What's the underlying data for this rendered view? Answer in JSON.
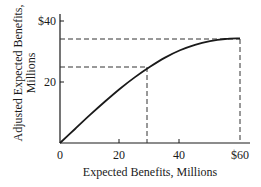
{
  "chart_data": {
    "type": "line",
    "title": "",
    "xlabel": "Expected Benefits, Millions",
    "ylabel_lines": [
      "Adjusted Expected Benefits,",
      "Millions"
    ],
    "ylabel": "Adjusted Expected Benefits, Millions",
    "xlim": [
      0,
      63
    ],
    "ylim": [
      0,
      40
    ],
    "x_ticks": [
      0,
      20,
      40,
      60
    ],
    "x_tick_labels": [
      "0",
      "20",
      "40",
      "$60"
    ],
    "y_ticks": [
      20,
      40
    ],
    "y_tick_labels": [
      "20",
      "$40"
    ],
    "grid": false,
    "legend": null,
    "series": [
      {
        "name": "Adjusted expected benefits",
        "x": [
          0,
          5,
          10,
          15,
          20,
          25,
          30,
          35,
          40,
          45,
          50,
          55,
          60
        ],
        "y": [
          0,
          4.6,
          9.2,
          13.6,
          17.8,
          21.6,
          25,
          28,
          30.4,
          32.2,
          33.4,
          34.1,
          34.3
        ]
      }
    ],
    "annotations": [
      {
        "type": "dashed-guide",
        "x": 30,
        "y": 25,
        "description": "Expected benefits 30 maps to adjusted benefits 25"
      },
      {
        "type": "dashed-guide",
        "x": 60,
        "y": 34.3,
        "description": "Expected benefits 60 maps to adjusted benefits ~34"
      }
    ]
  },
  "labels": {
    "xlabel": "Expected Benefits, Millions",
    "ylabel_line1": "Adjusted Expected Benefits,",
    "ylabel_line2": "Millions",
    "xt0": "0",
    "xt1": "20",
    "xt2": "40",
    "xt3": "$60",
    "yt1": "20",
    "yt2": "$40"
  }
}
